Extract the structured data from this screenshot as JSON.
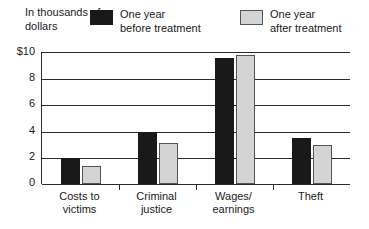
{
  "header": {
    "axis_unit_label": "In thousands\nof dollars"
  },
  "legend": {
    "items": [
      {
        "label": "One year\nbefore treatment",
        "swatch": "black-filled-square",
        "color": "#191919"
      },
      {
        "label": "One year\nafter treatment",
        "swatch": "gray-outlined-square",
        "color": "#d4d4d4"
      }
    ]
  },
  "chart_data": {
    "type": "bar",
    "title": "",
    "xlabel": "",
    "ylabel": "In thousands of dollars",
    "ylim": [
      0,
      10
    ],
    "yticks": [
      0,
      2,
      4,
      6,
      8,
      10
    ],
    "ytick_labels": [
      "0",
      "2",
      "4",
      "6",
      "8",
      "$10"
    ],
    "grid": true,
    "legend_position": "top",
    "categories": [
      "Costs to\nvictims",
      "Criminal\njustice",
      "Wages/\nearnings",
      "Theft"
    ],
    "series": [
      {
        "name": "One year before treatment",
        "color": "#191919",
        "values": [
          2.0,
          4.0,
          9.6,
          3.5
        ]
      },
      {
        "name": "One year after treatment",
        "color": "#d4d4d4",
        "values": [
          1.35,
          3.1,
          9.85,
          3.0
        ]
      }
    ]
  }
}
